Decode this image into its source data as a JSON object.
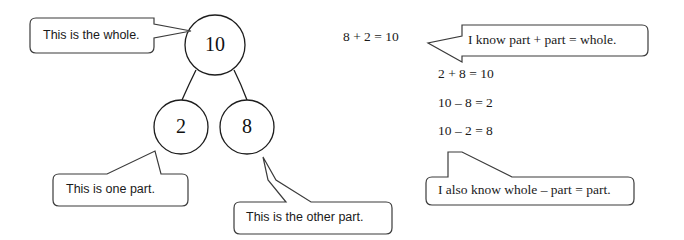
{
  "diagram": {
    "whole": {
      "value": "10",
      "cx": 215,
      "cy": 45,
      "r": 30
    },
    "parts": [
      {
        "value": "2",
        "cx": 181,
        "cy": 127,
        "r": 27
      },
      {
        "value": "8",
        "cx": 247,
        "cy": 127,
        "r": 27
      }
    ]
  },
  "callouts": [
    {
      "id": "whole-callout",
      "text": "This is the whole.",
      "box": {
        "x": 30,
        "y": 18,
        "w": 130,
        "h": 35
      },
      "text_x": 43,
      "text_y": 36
    },
    {
      "id": "one-part-callout",
      "text": "This is one part.",
      "box": {
        "x": 53,
        "y": 174,
        "w": 135,
        "h": 32
      },
      "text_x": 66,
      "text_y": 190
    },
    {
      "id": "other-part-callout",
      "text": "This is the other part.",
      "box": {
        "x": 234,
        "y": 202,
        "w": 158,
        "h": 32
      },
      "text_x": 246,
      "text_y": 218
    },
    {
      "id": "part-plus-part-callout",
      "text": "I know part + part = whole.",
      "box": {
        "x": 456,
        "y": 25,
        "w": 192,
        "h": 31
      },
      "text_x": 468,
      "text_y": 41
    },
    {
      "id": "whole-minus-part-callout",
      "text": "I also know whole – part = part.",
      "box": {
        "x": 426,
        "y": 177,
        "w": 208,
        "h": 28
      },
      "text_x": 438,
      "text_y": 191
    }
  ],
  "equations": [
    {
      "id": "equation-1",
      "text": "8 + 2 = 10",
      "x": 343,
      "y": 38
    },
    {
      "id": "equation-2",
      "text": "2 + 8 = 10",
      "x": 438,
      "y": 75
    },
    {
      "id": "equation-3",
      "text": "10 – 8 = 2",
      "x": 438,
      "y": 104
    },
    {
      "id": "equation-4",
      "text": "10 – 2 = 8",
      "x": 438,
      "y": 132
    }
  ],
  "colors": {
    "background": "#ffffff",
    "ink": "#1a1a1a",
    "outline": "#3b3b3b"
  }
}
